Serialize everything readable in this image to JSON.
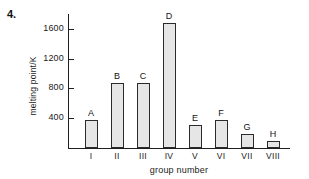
{
  "figure": {
    "question_number": "4."
  },
  "chart_data": {
    "type": "bar",
    "title": "",
    "xlabel": "group number",
    "ylabel": "melting point/K",
    "categories": [
      "I",
      "II",
      "III",
      "IV",
      "V",
      "VI",
      "VII",
      "VIII"
    ],
    "bar_labels": [
      "A",
      "B",
      "C",
      "D",
      "E",
      "F",
      "G",
      "H"
    ],
    "values": [
      380,
      870,
      880,
      1680,
      310,
      375,
      190,
      90
    ],
    "ylim": [
      0,
      1800
    ],
    "yticks": [
      400,
      800,
      1200,
      1600
    ],
    "ytick_labels": [
      "400",
      "800",
      "1200",
      "1600"
    ],
    "grid": false,
    "legend": false,
    "bar_fill": "#e6e6e6",
    "bar_edge": "#2b2b2b",
    "axis_color": "#1f1f1f"
  }
}
